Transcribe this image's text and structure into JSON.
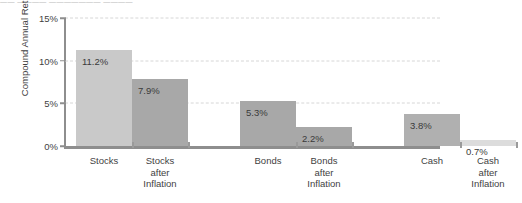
{
  "scan_artifact": {
    "top_sliver_text": "—— ———— ——————— ————"
  },
  "chart_data": {
    "type": "bar",
    "title": "",
    "xlabel": "",
    "ylabel": "Compound Annual Return",
    "ylim": [
      0,
      15
    ],
    "ytick_values": [
      0,
      5,
      10,
      15
    ],
    "ytick_labels": [
      "0%",
      "5%",
      "10%",
      "15%"
    ],
    "grid": true,
    "grid_axis": "y",
    "grid_style": "dashed",
    "legend": "none",
    "categories": [
      "Stocks",
      "Stocks after Inflation",
      "Bonds",
      "Bonds after Inflation",
      "Cash",
      "Cash after Inflation"
    ],
    "category_label_lines": [
      [
        "Stocks"
      ],
      [
        "Stocks",
        "after",
        "Inflation"
      ],
      [
        "Bonds"
      ],
      [
        "Bonds",
        "after",
        "Inflation"
      ],
      [
        "Cash"
      ],
      [
        "Cash",
        "after",
        "Inflation"
      ]
    ],
    "values": [
      11.2,
      7.9,
      5.3,
      2.2,
      3.8,
      0.7
    ],
    "value_labels": [
      "11.2%",
      "7.9%",
      "5.3%",
      "2.2%",
      "3.8%",
      "0.7%"
    ],
    "bar_colors": [
      "#c9c9c9",
      "#a8a8a8",
      "#a8a8a8",
      "#a8a8a8",
      "#b0b0b0",
      "#dcdcdc"
    ],
    "axis_color": "#8e8e8e",
    "gridline_color": "#d6d6d6",
    "text_color": "#3a3a3a",
    "background_color": "#ffffff"
  }
}
